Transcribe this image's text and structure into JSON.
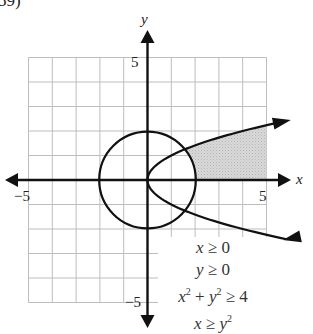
{
  "problem_number": "59)",
  "axes": {
    "x_label": "x",
    "y_label": "y",
    "x_min_label": "−5",
    "x_max_label": "5",
    "y_max_label": "5",
    "y_min_label": "−5"
  },
  "inequalities": [
    {
      "text": "x ≥ 0"
    },
    {
      "text": "y ≥ 0"
    },
    {
      "text": "x² + y² ≥ 4"
    },
    {
      "text": "x ≥ y²"
    }
  ],
  "colors": {
    "grid": "#bdbdbd",
    "axes": "#111111",
    "curves": "#111111",
    "shade": "#cfcfcf"
  },
  "chart_data": {
    "type": "area",
    "title": "59)",
    "xlabel": "x",
    "ylabel": "y",
    "xlim": [
      -5,
      5
    ],
    "ylim": [
      -5,
      5
    ],
    "grid": true,
    "grid_step": 1,
    "curves": [
      {
        "name": "circle",
        "equation": "x^2 + y^2 = 4",
        "center": [
          0,
          0
        ],
        "radius": 2
      },
      {
        "name": "parabola",
        "equation": "x = y^2",
        "vertex": [
          0,
          0
        ],
        "opens": "right"
      }
    ],
    "shaded_region": {
      "description": "x ≥ 0, y ≥ 0, outside circle x^2+y^2=4, below parabola x=y^2 (y ≤ √x), clipped at x=5",
      "boundary_points": [
        [
          1.56,
          1.25
        ],
        [
          2,
          1.414
        ],
        [
          3,
          1.732
        ],
        [
          4,
          2
        ],
        [
          5,
          2.236
        ],
        [
          5,
          0
        ],
        [
          2,
          0
        ]
      ]
    },
    "inequalities": [
      "x ≥ 0",
      "y ≥ 0",
      "x² + y² ≥ 4",
      "x ≥ y²"
    ],
    "tick_labels": {
      "x": [
        "−5",
        "5"
      ],
      "y": [
        "5",
        "−5"
      ]
    }
  }
}
